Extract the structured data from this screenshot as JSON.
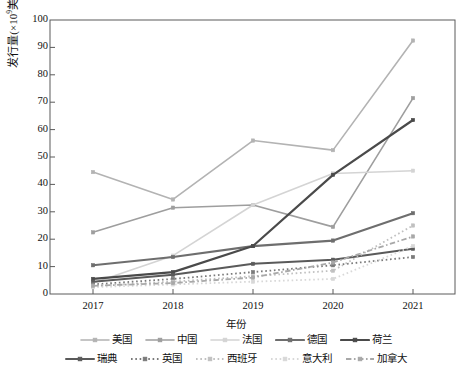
{
  "chart_data": {
    "type": "line",
    "title": "",
    "xlabel": "年份",
    "ylabel": "发行量(×10⁹美元)",
    "ylabel_base": "发行量(×10",
    "ylabel_sup": "9",
    "ylabel_tail": "美元)",
    "x": [
      "2017",
      "2018",
      "2019",
      "2020",
      "2021"
    ],
    "categories": [
      "2017",
      "2018",
      "2019",
      "2020",
      "2021"
    ],
    "ylim": [
      0,
      100
    ],
    "yticks": [
      0,
      10,
      20,
      30,
      40,
      50,
      60,
      70,
      80,
      90,
      100
    ],
    "grid": false,
    "legend_position": "bottom",
    "series": [
      {
        "name": "美国",
        "values": [
          44.5,
          34.5,
          56.0,
          52.5,
          92.5
        ],
        "color": "#b3b3b3",
        "style": "solid",
        "width": 1.6,
        "marker": "square"
      },
      {
        "name": "中国",
        "values": [
          22.5,
          31.5,
          32.5,
          24.5,
          71.5
        ],
        "color": "#9e9e9e",
        "style": "solid",
        "width": 1.6,
        "marker": "square"
      },
      {
        "name": "法国",
        "values": [
          4.0,
          14.0,
          32.5,
          44.0,
          45.0
        ],
        "color": "#d4d4d4",
        "style": "solid",
        "width": 1.6,
        "marker": "square"
      },
      {
        "name": "德国",
        "values": [
          10.5,
          13.5,
          17.5,
          19.5,
          29.5
        ],
        "color": "#6e6e6e",
        "style": "solid",
        "width": 2.2,
        "marker": "square"
      },
      {
        "name": "荷兰",
        "values": [
          5.5,
          8.0,
          17.5,
          43.5,
          63.5
        ],
        "color": "#4a4a4a",
        "style": "solid",
        "width": 2.2,
        "marker": "square"
      },
      {
        "name": "瑞典",
        "values": [
          4.5,
          7.0,
          11.0,
          12.5,
          16.5
        ],
        "color": "#5a5a5a",
        "style": "solid",
        "width": 2.0,
        "marker": "square"
      },
      {
        "name": "英国",
        "values": [
          3.5,
          5.5,
          8.0,
          10.5,
          13.5
        ],
        "color": "#7a7a7a",
        "style": "dotted",
        "width": 1.8,
        "marker": "square"
      },
      {
        "name": "西班牙",
        "values": [
          3.0,
          4.5,
          6.5,
          8.5,
          25.0
        ],
        "color": "#c0c0c0",
        "style": "dotted",
        "width": 1.8,
        "marker": "square"
      },
      {
        "name": "意大利",
        "values": [
          2.5,
          3.5,
          4.5,
          5.5,
          17.5
        ],
        "color": "#d8d8d8",
        "style": "dotted",
        "width": 1.8,
        "marker": "square"
      },
      {
        "name": "加拿大",
        "values": [
          3.0,
          4.0,
          6.0,
          11.5,
          21.0
        ],
        "color": "#a8a8a8",
        "style": "dashdot",
        "width": 1.8,
        "marker": "square"
      }
    ]
  },
  "legend": {
    "row1": [
      "美国",
      "中国",
      "法国",
      "德国",
      "荷兰"
    ],
    "row2": [
      "瑞典",
      "英国",
      "西班牙",
      "意大利",
      "加拿大"
    ]
  },
  "caption": {
    "text": ""
  }
}
